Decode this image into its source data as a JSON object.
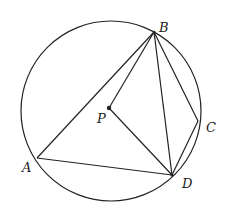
{
  "diagram": {
    "type": "geometry",
    "circle": {
      "cx": 111,
      "cy": 111,
      "r": 90
    },
    "points": {
      "A": {
        "x": 37,
        "y": 158,
        "label": "A",
        "lx": 22,
        "ly": 172
      },
      "B": {
        "x": 154,
        "y": 32,
        "label": "B",
        "lx": 159,
        "ly": 32
      },
      "C": {
        "x": 198,
        "y": 121,
        "label": "C",
        "lx": 206,
        "ly": 132
      },
      "D": {
        "x": 172,
        "y": 175,
        "label": "D",
        "lx": 182,
        "ly": 188
      },
      "P": {
        "x": 109,
        "y": 108,
        "label": "P",
        "lx": 97,
        "ly": 123
      }
    },
    "segments": [
      [
        "A",
        "B"
      ],
      [
        "B",
        "C"
      ],
      [
        "C",
        "D"
      ],
      [
        "D",
        "A"
      ],
      [
        "B",
        "D"
      ],
      [
        "B",
        "P"
      ],
      [
        "P",
        "D"
      ]
    ],
    "stroke_color": "#222222"
  }
}
